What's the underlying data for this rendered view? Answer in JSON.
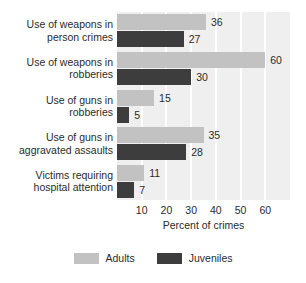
{
  "chart_data": {
    "type": "bar",
    "orientation": "horizontal",
    "title": "",
    "xlabel": "Percent of crimes",
    "ylabel": "",
    "xlim": [
      0,
      70
    ],
    "xticks": [
      10,
      20,
      30,
      40,
      50,
      60
    ],
    "grid": true,
    "legend_position": "bottom",
    "categories": [
      "Use of weapons in\nperson crimes",
      "Use of weapons in\nrobberies",
      "Use of guns in\nrobberies",
      "Use of guns in\naggravated assaults",
      "Victims requiring\nhospital attention"
    ],
    "series": [
      {
        "name": "Adults",
        "color": "#c2c2c2",
        "values": [
          36,
          60,
          15,
          35,
          11
        ],
        "value_labels": [
          "36",
          "60",
          "15",
          "35",
          "11"
        ]
      },
      {
        "name": "Juveniles",
        "color": "#3d3d3d",
        "values": [
          27,
          30,
          5,
          28,
          7
        ],
        "value_labels": [
          "27",
          "30",
          "5",
          "28",
          "7"
        ]
      }
    ]
  },
  "legend": {
    "items": [
      {
        "label": "Adults",
        "color": "#c2c2c2"
      },
      {
        "label": "Juveniles",
        "color": "#3d3d3d"
      }
    ]
  },
  "axis": {
    "x_title": "Percent of crimes",
    "tick_labels": [
      "10",
      "20",
      "30",
      "40",
      "50",
      "60"
    ]
  },
  "colors": {
    "plot_background": "#efefef",
    "gridline": "#ffffff",
    "page_background": "#ffffff",
    "text": "#2b2b2b",
    "adults": "#c2c2c2",
    "juveniles": "#3d3d3d"
  }
}
